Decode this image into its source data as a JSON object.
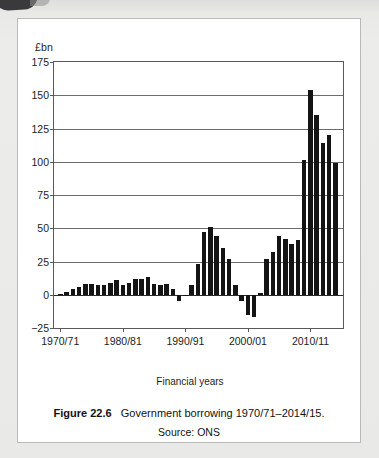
{
  "figure": {
    "caption_number": "Figure 22.6",
    "caption_text": "Government borrowing 1970/71–2014/15.",
    "source": "Source: ONS"
  },
  "colors": {
    "bar": "#141414",
    "axis": "#59595b",
    "grid": "#6b6b6d",
    "card_background": "#ffffff",
    "page_background": "#e9e9e7",
    "corner_tab": "#3a3a3c",
    "text": "#1d1d1d"
  },
  "chart_data": {
    "type": "bar",
    "title": "Government borrowing 1970/71–2014/15.",
    "subtitle": "Source: ONS",
    "xlabel": "Financial years",
    "ylabel": "£bn",
    "yunit": "£bn",
    "ylim": [
      -25,
      175
    ],
    "yticks": [
      175,
      150,
      125,
      100,
      75,
      50,
      25,
      0,
      -25
    ],
    "ytick_labels": [
      "175",
      "150",
      "125",
      "100",
      "75",
      "50",
      "25",
      "0",
      "−25"
    ],
    "xtick_labels": [
      "1970/71",
      "1980/81",
      "1990/91",
      "2000/01",
      "2010/11"
    ],
    "xtick_categories": [
      "1970/71",
      "1980/81",
      "1990/91",
      "2000/01",
      "2010/11"
    ],
    "grid": "horizontal",
    "legend": "none",
    "categories": [
      "1970/71",
      "1971/72",
      "1972/73",
      "1973/74",
      "1974/75",
      "1975/76",
      "1976/77",
      "1977/78",
      "1978/79",
      "1979/80",
      "1980/81",
      "1981/82",
      "1982/83",
      "1983/84",
      "1984/85",
      "1985/86",
      "1986/87",
      "1987/88",
      "1988/89",
      "1989/90",
      "1990/91",
      "1991/92",
      "1992/93",
      "1993/94",
      "1994/95",
      "1995/96",
      "1996/97",
      "1997/98",
      "1998/99",
      "1999/00",
      "2000/01",
      "2001/02",
      "2002/03",
      "2003/04",
      "2004/05",
      "2005/06",
      "2006/07",
      "2007/08",
      "2008/09",
      "2009/10",
      "2010/11",
      "2011/12",
      "2012/13",
      "2013/14",
      "2014/15"
    ],
    "values": [
      0.5,
      2,
      4,
      6,
      8,
      8,
      7,
      7,
      9,
      11,
      7,
      9,
      12,
      12,
      13,
      8,
      7,
      8,
      4,
      -5,
      -1,
      7,
      23,
      47,
      51,
      44,
      35,
      27,
      7,
      -5,
      -15,
      -17,
      1,
      27,
      32,
      44,
      42,
      38,
      41,
      101,
      154,
      135,
      114,
      120,
      99
    ]
  }
}
